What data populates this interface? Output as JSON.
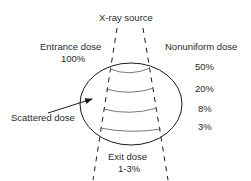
{
  "diagram": {
    "title": "X-ray source",
    "entrance": {
      "label": "Entrance dose",
      "value": "100%"
    },
    "nonuniform": {
      "label": "Nonuniform dose",
      "levels": [
        "50%",
        "20%",
        "8%",
        "3%"
      ]
    },
    "scattered": {
      "label": "Scattered dose"
    },
    "exit": {
      "label": "Exit dose",
      "value": "1-3%"
    },
    "colors": {
      "line": "#1a1a1a",
      "arc": "#7a7a7a",
      "text": "#2a2a2a"
    }
  }
}
